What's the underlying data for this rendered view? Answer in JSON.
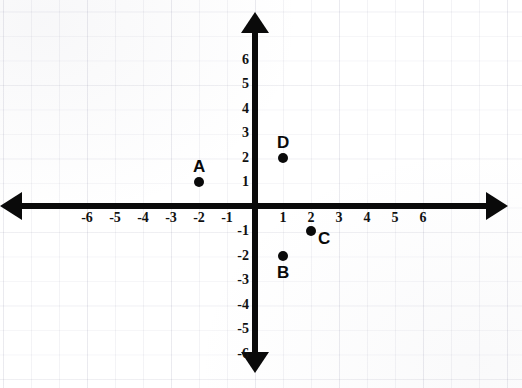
{
  "chart_data": {
    "type": "scatter",
    "title": "",
    "xlabel": "",
    "ylabel": "",
    "xlim": [
      -7,
      7
    ],
    "ylim": [
      -7,
      7
    ],
    "grid": true,
    "legend": "none",
    "x_ticks": [
      -6,
      -5,
      -4,
      -3,
      -2,
      -1,
      1,
      2,
      3,
      4,
      5,
      6
    ],
    "y_ticks": [
      6,
      5,
      4,
      3,
      2,
      1,
      -1,
      -2,
      -3,
      -4,
      -5,
      -6
    ],
    "x_tick_labels": [
      "-6",
      "-5",
      "-4",
      "-3",
      "-2",
      "-1",
      "1",
      "2",
      "3",
      "4",
      "5",
      "6"
    ],
    "y_tick_labels": [
      "6",
      "5",
      "4",
      "3",
      "2",
      "1",
      "-1",
      "-2",
      "-3",
      "-4",
      "-5",
      "-6"
    ],
    "points": [
      {
        "name": "A",
        "x": -2,
        "y": 1,
        "label_position": "above"
      },
      {
        "name": "B",
        "x": 1,
        "y": -2,
        "label_position": "below"
      },
      {
        "name": "C",
        "x": 2,
        "y": -1,
        "label_position": "right-below"
      },
      {
        "name": "D",
        "x": 1,
        "y": 2,
        "label_position": "above"
      }
    ],
    "colors": {
      "axis": "#0a0a0a",
      "point": "#0a0a0a",
      "label": "#0a0a0a",
      "grid": "#9696aa",
      "background": "#ffffff"
    }
  },
  "axes": {
    "x_axis_name": "x-axis",
    "y_axis_name": "y-axis",
    "origin_label": ""
  }
}
